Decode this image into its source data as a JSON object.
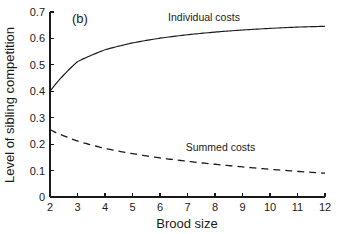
{
  "chart_data": {
    "type": "line",
    "title": "",
    "panel_label": "(b)",
    "xlabel": "Brood size",
    "ylabel": "Level of sibling competition",
    "xlim": [
      2,
      12
    ],
    "ylim": [
      0,
      0.7
    ],
    "grid": false,
    "legend_position": "inline-annotation",
    "xticks": [
      2,
      3,
      4,
      5,
      6,
      7,
      8,
      9,
      10,
      11,
      12
    ],
    "xticklabels": [
      "2",
      "3",
      "4",
      "5",
      "6",
      "7",
      "8",
      "9",
      "10",
      "11",
      "12"
    ],
    "yticks": [
      0,
      0.1,
      0.2,
      0.3,
      0.4,
      0.5,
      0.6,
      0.7
    ],
    "yticklabels": [
      "0",
      "0.1",
      "0.2",
      "0.3",
      "0.4",
      "0.5",
      "0.6",
      "0.7"
    ],
    "x": [
      2,
      3,
      4,
      5,
      6,
      7,
      8,
      9,
      10,
      11,
      12
    ],
    "series": [
      {
        "name": "Individual costs",
        "style": "solid",
        "color": "#1a1a1a",
        "label_x": 7.6,
        "label_y": 0.665,
        "values": [
          0.4,
          0.512,
          0.557,
          0.583,
          0.601,
          0.614,
          0.624,
          0.632,
          0.638,
          0.643,
          0.646
        ]
      },
      {
        "name": "Summed costs",
        "style": "dashed",
        "color": "#1a1a1a",
        "label_x": 8.2,
        "label_y": 0.175,
        "values": [
          0.255,
          0.212,
          0.184,
          0.164,
          0.148,
          0.135,
          0.124,
          0.114,
          0.105,
          0.097,
          0.09
        ]
      }
    ]
  }
}
